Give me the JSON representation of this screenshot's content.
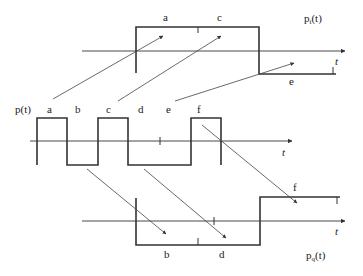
{
  "diagram": {
    "type": "signal-decomposition",
    "colors": {
      "line": "#333333",
      "background": "#ffffff"
    },
    "top_signal": {
      "name": "p_i(t)",
      "label_main": "p",
      "label_sub": "i",
      "label_tail": "(t)",
      "axis_label": "t",
      "segment_labels": [
        "a",
        "c",
        "e"
      ]
    },
    "middle_signal": {
      "name": "p(t)",
      "label": "p(t)",
      "axis_label": "t",
      "segment_labels": [
        "a",
        "b",
        "c",
        "d",
        "e",
        "f"
      ]
    },
    "bottom_signal": {
      "name": "p_q(t)",
      "label_main": "p",
      "label_sub": "q",
      "label_tail": "(t)",
      "axis_label": "t",
      "segment_labels": [
        "b",
        "d",
        "f"
      ]
    },
    "mappings": [
      {
        "from": "a",
        "to": "p_i"
      },
      {
        "from": "c",
        "to": "p_i"
      },
      {
        "from": "e",
        "to": "p_i"
      },
      {
        "from": "b",
        "to": "p_q"
      },
      {
        "from": "d",
        "to": "p_q"
      },
      {
        "from": "f",
        "to": "p_q"
      }
    ]
  }
}
